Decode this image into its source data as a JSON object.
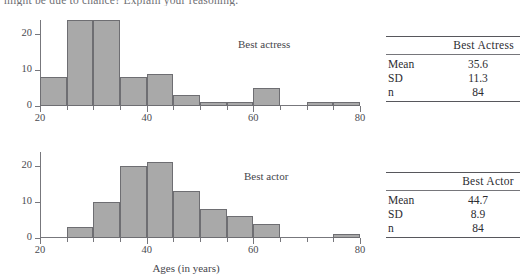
{
  "question": {
    "text": "might be due to chance? Explain your reasoning."
  },
  "figure": {
    "xaxis_title": "Ages (in years)"
  },
  "chart_data": [
    {
      "type": "bar",
      "title": "Best actress",
      "xlabel": "Ages (in years)",
      "ylabel": "",
      "xlim": [
        20,
        80
      ],
      "ylim": [
        0,
        25
      ],
      "bin_width": 5,
      "bin_starts": [
        20,
        25,
        30,
        35,
        40,
        45,
        50,
        55,
        60,
        65,
        70,
        75
      ],
      "categories": [
        "20-25",
        "25-30",
        "30-35",
        "35-40",
        "40-45",
        "45-50",
        "50-55",
        "55-60",
        "60-65",
        "65-70",
        "70-75",
        "75-80"
      ],
      "values": [
        8,
        24,
        24,
        8,
        9,
        3,
        1,
        1,
        5,
        0,
        1,
        1
      ],
      "ytick_labels": [
        "0",
        "10",
        "20"
      ],
      "ytick_values": [
        0,
        10,
        20
      ],
      "xtick_labels": [
        "20",
        "40",
        "60",
        "80"
      ],
      "xtick_values": [
        20,
        40,
        60,
        80
      ],
      "minor_xticks": [
        25,
        30,
        35,
        45,
        50,
        55,
        65,
        70,
        75
      ],
      "grid": false,
      "legend": "none",
      "bar_color": "#a9a9a9",
      "bar_edge_color": "#6e6e72"
    },
    {
      "type": "bar",
      "title": "Best actor",
      "xlabel": "Ages (in years)",
      "ylabel": "",
      "xlim": [
        20,
        80
      ],
      "ylim": [
        0,
        25
      ],
      "bin_width": 5,
      "bin_starts": [
        20,
        25,
        30,
        35,
        40,
        45,
        50,
        55,
        60,
        65,
        70,
        75
      ],
      "categories": [
        "20-25",
        "25-30",
        "30-35",
        "35-40",
        "40-45",
        "45-50",
        "50-55",
        "55-60",
        "60-65",
        "65-70",
        "70-75",
        "75-80"
      ],
      "values": [
        0,
        3,
        10,
        20,
        21,
        13,
        8,
        6,
        4,
        0,
        0,
        1
      ],
      "ytick_labels": [
        "0",
        "10",
        "20"
      ],
      "ytick_values": [
        0,
        10,
        20
      ],
      "xtick_labels": [
        "20",
        "40",
        "60",
        "80"
      ],
      "xtick_values": [
        20,
        40,
        60,
        80
      ],
      "minor_xticks": [
        25,
        30,
        35,
        45,
        50,
        55,
        65,
        70,
        75
      ],
      "grid": false,
      "legend": "none",
      "bar_color": "#a9a9a9",
      "bar_edge_color": "#6e6e72"
    }
  ],
  "tables": [
    {
      "header": "Best Actress",
      "rows": [
        {
          "label": "Mean",
          "value": "35.6"
        },
        {
          "label": "SD",
          "value": "11.3"
        },
        {
          "label": "n",
          "value": "84"
        }
      ]
    },
    {
      "header": "Best Actor",
      "rows": [
        {
          "label": "Mean",
          "value": "44.7"
        },
        {
          "label": "SD",
          "value": "8.9"
        },
        {
          "label": "n",
          "value": "84"
        }
      ]
    }
  ]
}
